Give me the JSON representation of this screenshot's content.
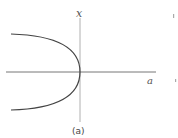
{
  "figure": {
    "y_axis_label": "x",
    "x_axis_label": "a",
    "caption": "(a)",
    "curve": "parabola opening left, vertex at origin (saddle-node bifurcation)",
    "colors": {
      "axis": "#9a9a9a",
      "curve": "#444444",
      "text": "#555555"
    }
  }
}
